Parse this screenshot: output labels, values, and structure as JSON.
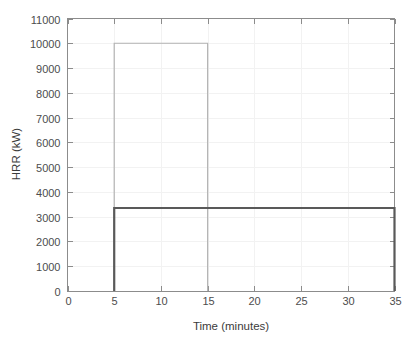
{
  "chart_data": {
    "type": "line",
    "title": "",
    "subtitle": "",
    "xlabel": "Time (minutes)",
    "ylabel": "HRR (kW)",
    "xlim": [
      0,
      35
    ],
    "ylim": [
      0,
      11000
    ],
    "xticks": [
      0,
      5,
      10,
      15,
      20,
      25,
      30,
      35
    ],
    "xtick_labels": [
      "0",
      "5",
      "10",
      "15",
      "20",
      "25",
      "30",
      "35"
    ],
    "yticks": [
      0,
      1000,
      2000,
      3000,
      4000,
      5000,
      6000,
      7000,
      8000,
      9000,
      10000,
      11000
    ],
    "ytick_labels": [
      "0",
      "1000",
      "2000",
      "3000",
      "4000",
      "5000",
      "6000",
      "7000",
      "8000",
      "9000",
      "10000",
      "11000"
    ],
    "grid": true,
    "legend": null,
    "legend_position": "none",
    "series": [
      {
        "name": "light-gray-pulse",
        "color": "#b3b3b3",
        "linewidth": 1.2,
        "x": [
          5,
          5,
          15,
          15
        ],
        "y": [
          0,
          10000,
          10000,
          0
        ],
        "peak_value": 10000,
        "start_minute": 5,
        "end_minute": 15
      },
      {
        "name": "dark-gray-pulse",
        "color": "#595959",
        "linewidth": 2.2,
        "x": [
          5,
          5,
          35,
          35
        ],
        "y": [
          0,
          3350,
          3350,
          0
        ],
        "peak_value": 3350,
        "start_minute": 5,
        "end_minute": 35
      }
    ],
    "annotations": []
  },
  "figure": {
    "background_color": "#ffffff",
    "axes_color": "#8c8c8c",
    "grid_color": "#f2f2f2",
    "text_color": "#4d4d4d"
  }
}
